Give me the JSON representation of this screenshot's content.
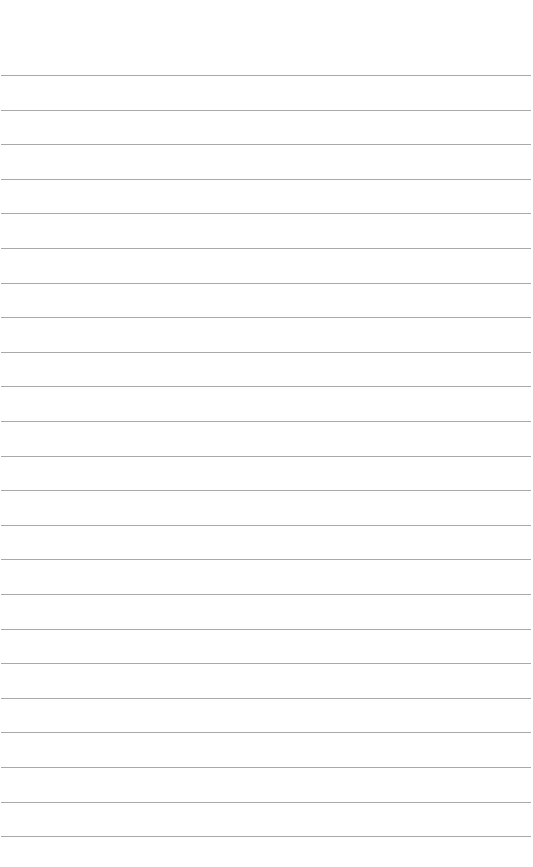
{
  "page": {
    "type": "blank lined paper",
    "background_color": "#ffffff",
    "rule_color": "#9a9a9a",
    "rule_count": 23,
    "first_rule_y": 75,
    "rule_spacing": 34.6
  }
}
